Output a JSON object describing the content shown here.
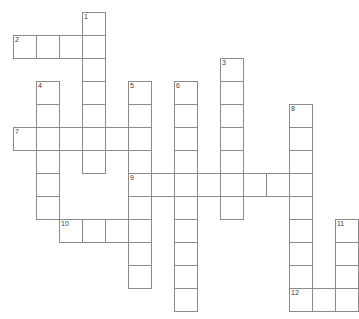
{
  "puzzle": {
    "title": "Crossword Grid",
    "cell_size": 23,
    "origin": {
      "x": 13,
      "y": 12
    },
    "grid_cols": 15,
    "grid_rows": 13,
    "colors": {
      "cell_border": "#8a8a8a",
      "cell_fill": "#ffffff",
      "number_text": "#3a3a3a",
      "background": "#ffffff"
    },
    "clue_numbers": [
      "1",
      "2",
      "3",
      "4",
      "5",
      "6",
      "7",
      "8",
      "9",
      "10",
      "11",
      "12"
    ],
    "entries": [
      {
        "number": "1",
        "direction": "down",
        "col": 3,
        "row": 0,
        "length": 7
      },
      {
        "number": "2",
        "direction": "across",
        "col": 0,
        "row": 1,
        "length": 4
      },
      {
        "number": "3",
        "direction": "down",
        "col": 9,
        "row": 2,
        "length": 8
      },
      {
        "number": "4",
        "direction": "down",
        "col": 1,
        "row": 3,
        "length": 6
      },
      {
        "number": "5",
        "direction": "down",
        "col": 5,
        "row": 3,
        "length": 9
      },
      {
        "number": "6",
        "direction": "down",
        "col": 7,
        "row": 3,
        "length": 10
      },
      {
        "number": "7",
        "direction": "across",
        "col": 0,
        "row": 5,
        "length": 6
      },
      {
        "number": "8",
        "direction": "down",
        "col": 12,
        "row": 5,
        "length": 9
      },
      {
        "number": "9",
        "direction": "across",
        "col": 5,
        "row": 7,
        "length": 8
      },
      {
        "number": "10",
        "direction": "across",
        "col": 2,
        "row": 9,
        "length": 4
      },
      {
        "number": "11",
        "direction": "down",
        "col": 14,
        "row": 9,
        "length": 4
      },
      {
        "number": "12",
        "direction": "across",
        "col": 12,
        "row": 12,
        "length": 3
      }
    ],
    "cells": [
      {
        "col": 3,
        "row": 0,
        "number": "1"
      },
      {
        "col": 0,
        "row": 1,
        "number": "2"
      },
      {
        "col": 1,
        "row": 1,
        "number": ""
      },
      {
        "col": 2,
        "row": 1,
        "number": ""
      },
      {
        "col": 3,
        "row": 1,
        "number": ""
      },
      {
        "col": 3,
        "row": 2,
        "number": ""
      },
      {
        "col": 9,
        "row": 2,
        "number": "3"
      },
      {
        "col": 1,
        "row": 3,
        "number": "4"
      },
      {
        "col": 3,
        "row": 3,
        "number": ""
      },
      {
        "col": 5,
        "row": 3,
        "number": "5"
      },
      {
        "col": 7,
        "row": 3,
        "number": "6"
      },
      {
        "col": 9,
        "row": 3,
        "number": ""
      },
      {
        "col": 1,
        "row": 4,
        "number": ""
      },
      {
        "col": 3,
        "row": 4,
        "number": ""
      },
      {
        "col": 5,
        "row": 4,
        "number": ""
      },
      {
        "col": 7,
        "row": 4,
        "number": ""
      },
      {
        "col": 9,
        "row": 4,
        "number": ""
      },
      {
        "col": 12,
        "row": 4,
        "number": "8"
      },
      {
        "col": 0,
        "row": 5,
        "number": "7"
      },
      {
        "col": 1,
        "row": 5,
        "number": ""
      },
      {
        "col": 2,
        "row": 5,
        "number": ""
      },
      {
        "col": 3,
        "row": 5,
        "number": ""
      },
      {
        "col": 4,
        "row": 5,
        "number": ""
      },
      {
        "col": 5,
        "row": 5,
        "number": ""
      },
      {
        "col": 7,
        "row": 5,
        "number": ""
      },
      {
        "col": 9,
        "row": 5,
        "number": ""
      },
      {
        "col": 12,
        "row": 5,
        "number": ""
      },
      {
        "col": 1,
        "row": 6,
        "number": ""
      },
      {
        "col": 3,
        "row": 6,
        "number": ""
      },
      {
        "col": 5,
        "row": 6,
        "number": ""
      },
      {
        "col": 7,
        "row": 6,
        "number": ""
      },
      {
        "col": 9,
        "row": 6,
        "number": ""
      },
      {
        "col": 12,
        "row": 6,
        "number": ""
      },
      {
        "col": 1,
        "row": 7,
        "number": ""
      },
      {
        "col": 5,
        "row": 7,
        "number": "9"
      },
      {
        "col": 6,
        "row": 7,
        "number": ""
      },
      {
        "col": 7,
        "row": 7,
        "number": ""
      },
      {
        "col": 8,
        "row": 7,
        "number": ""
      },
      {
        "col": 9,
        "row": 7,
        "number": ""
      },
      {
        "col": 10,
        "row": 7,
        "number": ""
      },
      {
        "col": 11,
        "row": 7,
        "number": ""
      },
      {
        "col": 12,
        "row": 7,
        "number": ""
      },
      {
        "col": 1,
        "row": 8,
        "number": ""
      },
      {
        "col": 5,
        "row": 8,
        "number": ""
      },
      {
        "col": 7,
        "row": 8,
        "number": ""
      },
      {
        "col": 9,
        "row": 8,
        "number": ""
      },
      {
        "col": 12,
        "row": 8,
        "number": ""
      },
      {
        "col": 2,
        "row": 9,
        "number": "10"
      },
      {
        "col": 3,
        "row": 9,
        "number": ""
      },
      {
        "col": 4,
        "row": 9,
        "number": ""
      },
      {
        "col": 5,
        "row": 9,
        "number": ""
      },
      {
        "col": 7,
        "row": 9,
        "number": ""
      },
      {
        "col": 12,
        "row": 9,
        "number": ""
      },
      {
        "col": 14,
        "row": 9,
        "number": "11"
      },
      {
        "col": 5,
        "row": 10,
        "number": ""
      },
      {
        "col": 7,
        "row": 10,
        "number": ""
      },
      {
        "col": 12,
        "row": 10,
        "number": ""
      },
      {
        "col": 14,
        "row": 10,
        "number": ""
      },
      {
        "col": 5,
        "row": 11,
        "number": ""
      },
      {
        "col": 7,
        "row": 11,
        "number": ""
      },
      {
        "col": 12,
        "row": 11,
        "number": ""
      },
      {
        "col": 14,
        "row": 11,
        "number": ""
      },
      {
        "col": 7,
        "row": 12,
        "number": ""
      },
      {
        "col": 12,
        "row": 12,
        "number": "12"
      },
      {
        "col": 13,
        "row": 12,
        "number": ""
      },
      {
        "col": 14,
        "row": 12,
        "number": ""
      }
    ]
  }
}
